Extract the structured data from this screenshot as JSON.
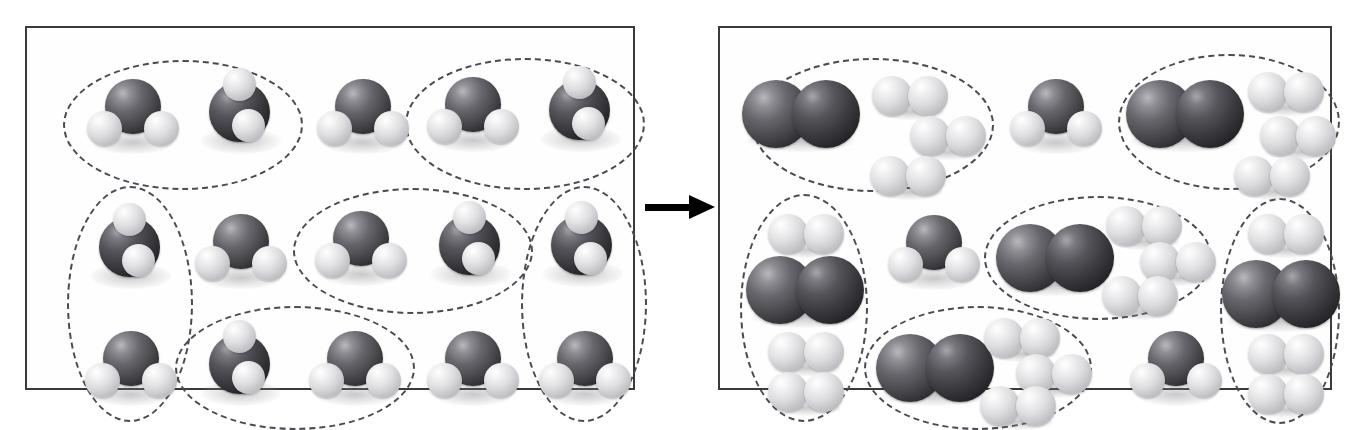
{
  "figure": {
    "type": "chemical-reaction-diagram",
    "caption": "",
    "reaction_equation": "2 H2O  →  2 H2 + O2",
    "arrow": {
      "direction": "right",
      "label": "",
      "color": "#000000"
    }
  },
  "legend": {
    "atoms": [
      {
        "element": "O",
        "name": "oxygen",
        "color": "#4a4a4f",
        "radius_px": 27,
        "appearance": "large dark grey sphere"
      },
      {
        "element": "H",
        "name": "hydrogen",
        "color": "#dedee1",
        "radius_px": 15,
        "appearance": "small light grey sphere"
      }
    ],
    "grouping": {
      "style": "dashed-ellipse",
      "color": "#4a4a52",
      "meaning": "reacting set"
    }
  },
  "panels": [
    {
      "id": "reactants",
      "title": "",
      "species_summary": [
        {
          "formula": "H2O",
          "name": "water",
          "count": 15
        }
      ],
      "molecules": [
        {
          "id": "w1",
          "formula": "H2O",
          "pose": "front",
          "x": 60,
          "y": 48,
          "w": 92,
          "h": 78
        },
        {
          "id": "w2",
          "formula": "H2O",
          "pose": "tilted",
          "x": 168,
          "y": 40,
          "w": 92,
          "h": 86
        },
        {
          "id": "w3",
          "formula": "H2O",
          "pose": "front",
          "x": 290,
          "y": 48,
          "w": 92,
          "h": 78
        },
        {
          "id": "w4",
          "formula": "H2O",
          "pose": "front",
          "x": 400,
          "y": 46,
          "w": 92,
          "h": 78
        },
        {
          "id": "w5",
          "formula": "H2O",
          "pose": "tilted",
          "x": 508,
          "y": 38,
          "w": 92,
          "h": 86
        },
        {
          "id": "w6",
          "formula": "H2O",
          "pose": "tilted",
          "x": 58,
          "y": 175,
          "w": 92,
          "h": 86
        },
        {
          "id": "w7",
          "formula": "H2O",
          "pose": "front",
          "x": 168,
          "y": 183,
          "w": 92,
          "h": 78
        },
        {
          "id": "w8",
          "formula": "H2O",
          "pose": "front",
          "x": 288,
          "y": 180,
          "w": 92,
          "h": 78
        },
        {
          "id": "w9",
          "formula": "H2O",
          "pose": "tilted",
          "x": 398,
          "y": 173,
          "w": 92,
          "h": 86
        },
        {
          "id": "w10",
          "formula": "H2O",
          "pose": "tilted",
          "x": 510,
          "y": 173,
          "w": 92,
          "h": 86
        },
        {
          "id": "w11",
          "formula": "H2O",
          "pose": "front",
          "x": 58,
          "y": 300,
          "w": 92,
          "h": 78
        },
        {
          "id": "w12",
          "formula": "H2O",
          "pose": "tilted",
          "x": 168,
          "y": 292,
          "w": 92,
          "h": 86
        },
        {
          "id": "w13",
          "formula": "H2O",
          "pose": "front",
          "x": 282,
          "y": 300,
          "w": 92,
          "h": 78
        },
        {
          "id": "w14",
          "formula": "H2O",
          "pose": "front",
          "x": 400,
          "y": 300,
          "w": 92,
          "h": 78
        },
        {
          "id": "w15",
          "formula": "H2O",
          "pose": "front",
          "x": 512,
          "y": 300,
          "w": 92,
          "h": 78
        }
      ],
      "groups": [
        {
          "id": "g1",
          "orientation": "horizontal",
          "members": [
            "w1",
            "w2"
          ],
          "x": 36,
          "y": 32,
          "w": 240,
          "h": 130
        },
        {
          "id": "g2",
          "orientation": "horizontal",
          "members": [
            "w4",
            "w5"
          ],
          "x": 378,
          "y": 30,
          "w": 240,
          "h": 132
        },
        {
          "id": "g3",
          "orientation": "vertical",
          "members": [
            "w6",
            "w11"
          ],
          "x": 40,
          "y": 158,
          "w": 126,
          "h": 236
        },
        {
          "id": "g4",
          "orientation": "horizontal",
          "members": [
            "w8",
            "w9"
          ],
          "x": 266,
          "y": 160,
          "w": 240,
          "h": 126
        },
        {
          "id": "g5",
          "orientation": "vertical",
          "members": [
            "w10",
            "w15"
          ],
          "x": 494,
          "y": 158,
          "w": 126,
          "h": 236
        },
        {
          "id": "g6",
          "orientation": "horizontal",
          "members": [
            "w12",
            "w13"
          ],
          "x": 148,
          "y": 278,
          "w": 240,
          "h": 124
        }
      ]
    },
    {
      "id": "products",
      "title": "",
      "species_summary": [
        {
          "formula": "O2",
          "name": "oxygen gas",
          "count": 5
        },
        {
          "formula": "H2",
          "name": "hydrogen gas",
          "count": 12
        },
        {
          "formula": "H2O",
          "name": "unreacted water",
          "count": 3
        }
      ],
      "molecules": [
        {
          "id": "o1",
          "formula": "O2",
          "x": 22,
          "y": 52,
          "w": 118,
          "h": 68
        },
        {
          "id": "h1",
          "formula": "H2",
          "x": 152,
          "y": 48,
          "w": 76,
          "h": 40
        },
        {
          "id": "h2",
          "formula": "H2",
          "x": 190,
          "y": 88,
          "w": 76,
          "h": 40
        },
        {
          "id": "h3",
          "formula": "H2",
          "x": 150,
          "y": 128,
          "w": 76,
          "h": 40
        },
        {
          "id": "wp1",
          "formula": "H2O",
          "x": 290,
          "y": 48,
          "w": 92,
          "h": 78
        },
        {
          "id": "o2",
          "formula": "O2",
          "x": 406,
          "y": 52,
          "w": 118,
          "h": 68
        },
        {
          "id": "h4",
          "formula": "H2",
          "x": 528,
          "y": 44,
          "w": 76,
          "h": 40
        },
        {
          "id": "h5",
          "formula": "H2",
          "x": 540,
          "y": 88,
          "w": 76,
          "h": 40
        },
        {
          "id": "h6",
          "formula": "H2",
          "x": 514,
          "y": 128,
          "w": 76,
          "h": 40
        },
        {
          "id": "h7",
          "formula": "H2",
          "x": 48,
          "y": 186,
          "w": 76,
          "h": 40
        },
        {
          "id": "o3",
          "formula": "O2",
          "x": 26,
          "y": 228,
          "w": 118,
          "h": 68
        },
        {
          "id": "h8",
          "formula": "H2",
          "x": 48,
          "y": 304,
          "w": 76,
          "h": 40
        },
        {
          "id": "h9",
          "formula": "H2",
          "x": 48,
          "y": 344,
          "w": 76,
          "h": 40
        },
        {
          "id": "wp2",
          "formula": "H2O",
          "x": 168,
          "y": 184,
          "w": 92,
          "h": 78
        },
        {
          "id": "o4",
          "formula": "O2",
          "x": 276,
          "y": 196,
          "w": 118,
          "h": 68
        },
        {
          "id": "h10",
          "formula": "H2",
          "x": 386,
          "y": 178,
          "w": 76,
          "h": 40
        },
        {
          "id": "h11",
          "formula": "H2",
          "x": 420,
          "y": 214,
          "w": 76,
          "h": 40
        },
        {
          "id": "h12",
          "formula": "H2",
          "x": 382,
          "y": 248,
          "w": 76,
          "h": 40
        },
        {
          "id": "h13",
          "formula": "H2",
          "x": 528,
          "y": 186,
          "w": 76,
          "h": 40
        },
        {
          "id": "o5",
          "formula": "O2",
          "x": 502,
          "y": 232,
          "w": 118,
          "h": 68
        },
        {
          "id": "h14",
          "formula": "H2",
          "x": 528,
          "y": 306,
          "w": 76,
          "h": 40
        },
        {
          "id": "h15",
          "formula": "H2",
          "x": 528,
          "y": 346,
          "w": 76,
          "h": 40
        },
        {
          "id": "o6",
          "formula": "O2",
          "x": 156,
          "y": 306,
          "w": 118,
          "h": 68
        },
        {
          "id": "h16",
          "formula": "H2",
          "x": 264,
          "y": 290,
          "w": 76,
          "h": 40
        },
        {
          "id": "h17",
          "formula": "H2",
          "x": 296,
          "y": 326,
          "w": 76,
          "h": 40
        },
        {
          "id": "h18",
          "formula": "H2",
          "x": 260,
          "y": 358,
          "w": 76,
          "h": 40
        },
        {
          "id": "wp3",
          "formula": "H2O",
          "x": 410,
          "y": 300,
          "w": 92,
          "h": 78
        }
      ],
      "groups": [
        {
          "id": "pg1",
          "orientation": "horizontal",
          "members": [
            "o1",
            "h1",
            "h2",
            "h3"
          ],
          "x": 32,
          "y": 30,
          "w": 242,
          "h": 134
        },
        {
          "id": "pg2",
          "orientation": "horizontal",
          "members": [
            "o2",
            "h4",
            "h5",
            "h6"
          ],
          "x": 398,
          "y": 26,
          "w": 222,
          "h": 136
        },
        {
          "id": "pg3",
          "orientation": "vertical",
          "members": [
            "h7",
            "o3",
            "h8",
            "h9"
          ],
          "x": 20,
          "y": 166,
          "w": 128,
          "h": 228
        },
        {
          "id": "pg4",
          "orientation": "horizontal",
          "members": [
            "o4",
            "h10",
            "h11",
            "h12"
          ],
          "x": 264,
          "y": 168,
          "w": 228,
          "h": 124
        },
        {
          "id": "pg5",
          "orientation": "vertical",
          "members": [
            "h13",
            "o5",
            "h14",
            "h15"
          ],
          "x": 500,
          "y": 170,
          "w": 120,
          "h": 226
        },
        {
          "id": "pg6",
          "orientation": "horizontal",
          "members": [
            "o6",
            "h16",
            "h17",
            "h18"
          ],
          "x": 144,
          "y": 278,
          "w": 228,
          "h": 124
        }
      ]
    }
  ]
}
